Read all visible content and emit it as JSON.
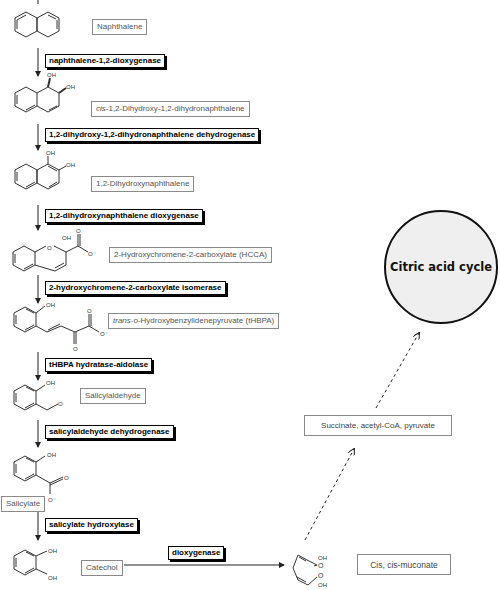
{
  "compounds": [
    {
      "id": "naphthalene",
      "label": "Naphthalene"
    },
    {
      "id": "cis-dihydrodiol",
      "label_prefix": "cis",
      "label": "-1,2-Dihydroxy-1,2-dihydronaphthalene"
    },
    {
      "id": "dihydroxynaphthalene",
      "label": "1,2-Dihydroxynaphthalene"
    },
    {
      "id": "hcca",
      "label": "2-Hydroxychromene-2-carboxylate (HCCA)"
    },
    {
      "id": "thbpa",
      "label_prefix": "trans-o",
      "label": "-Hydroxybenzylidenepyruvate (tHBPA)"
    },
    {
      "id": "salicylaldehyde",
      "label": "Salicylaldehyde"
    },
    {
      "id": "salicylate",
      "label": "Salicylate"
    },
    {
      "id": "catechol",
      "label": "Catechol"
    },
    {
      "id": "muconate",
      "label": "Cis, cis-muconate"
    }
  ],
  "enzymes": [
    {
      "id": "e1",
      "label": "naphthalene-1,2-dioxygenase"
    },
    {
      "id": "e2",
      "label": "1,2-dihydroxy-1,2-dihydronaphthalene dehydrogenase"
    },
    {
      "id": "e3",
      "label": "1,2-dihydroxynaphthalene dioxygenase"
    },
    {
      "id": "e4",
      "label": "2-hydroxychromene-2-carboxylate isomerase"
    },
    {
      "id": "e5",
      "label": "tHBPA hydratase-aldolase"
    },
    {
      "id": "e6",
      "label": "salicylaldehyde dehydrogenase"
    },
    {
      "id": "e7",
      "label": "salicylate hydroxylase"
    },
    {
      "id": "e8",
      "label": "dioxygenase"
    }
  ],
  "products": {
    "label": "Succinate, acetyl-CoA, pyruvate"
  },
  "cycle": {
    "label": "Citric acid cycle"
  },
  "atoms": {
    "oh": "OH",
    "o": "O",
    "o_minus": "O",
    "charge": "-"
  }
}
